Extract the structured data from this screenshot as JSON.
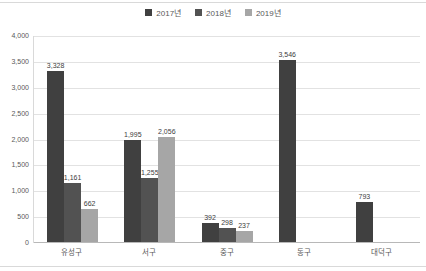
{
  "chart_data": {
    "type": "bar",
    "title": "",
    "categories": [
      "유성구",
      "서구",
      "중구",
      "동구",
      "대덕구"
    ],
    "series": [
      {
        "name": "2017년",
        "color": "#404040",
        "values": [
          3328,
          1995,
          392,
          3546,
          793
        ]
      },
      {
        "name": "2018년",
        "color": "#525252",
        "values": [
          1161,
          1255,
          298,
          null,
          null
        ]
      },
      {
        "name": "2019년",
        "color": "#a6a6a6",
        "values": [
          662,
          2056,
          237,
          null,
          null
        ]
      }
    ],
    "ylim": [
      0,
      4000
    ],
    "ytick_step": 500,
    "yticks_top_to_bottom": [
      "4,000",
      "3,500",
      "3,000",
      "2,500",
      "2,000",
      "1,500",
      "1,000",
      "500",
      "0"
    ],
    "grid": true,
    "legend_position": "top-center",
    "data_labels": true
  }
}
